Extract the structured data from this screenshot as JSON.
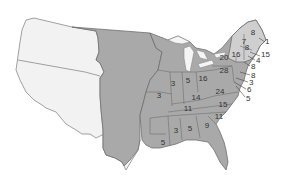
{
  "map": {
    "colors": {
      "background": "#ffffff",
      "territory_light": "#f2f2f2",
      "states_dark": "#a9a9a9",
      "new_england_light": "#cfcfcf",
      "border": "#6e6e6e",
      "lakes": "#f5f5f5"
    },
    "state_labels": [
      {
        "value": "8",
        "x": 253,
        "y": 33
      },
      {
        "value": "1",
        "x": 266,
        "y": 42
      },
      {
        "value": "7",
        "x": 244,
        "y": 42
      },
      {
        "value": "8",
        "x": 247,
        "y": 48
      },
      {
        "value": "16",
        "x": 236,
        "y": 55
      },
      {
        "value": "20",
        "x": 224,
        "y": 58
      },
      {
        "value": "28",
        "x": 224,
        "y": 71
      },
      {
        "value": "16",
        "x": 203,
        "y": 79
      },
      {
        "value": "5",
        "x": 188,
        "y": 81
      },
      {
        "value": "3",
        "x": 173,
        "y": 84
      },
      {
        "value": "3",
        "x": 159,
        "y": 96
      },
      {
        "value": "24",
        "x": 220,
        "y": 92
      },
      {
        "value": "14",
        "x": 196,
        "y": 98
      },
      {
        "value": "15",
        "x": 223,
        "y": 105
      },
      {
        "value": "11",
        "x": 188,
        "y": 109
      },
      {
        "value": "11",
        "x": 219,
        "y": 117
      },
      {
        "value": "3",
        "x": 176,
        "y": 131
      },
      {
        "value": "5",
        "x": 190,
        "y": 129
      },
      {
        "value": "9",
        "x": 207,
        "y": 126
      },
      {
        "value": "5",
        "x": 163,
        "y": 143
      }
    ],
    "leader_labels": [
      {
        "value": "15",
        "x": 262,
        "y": 55
      },
      {
        "value": "4",
        "x": 256,
        "y": 60
      },
      {
        "value": "8",
        "x": 251,
        "y": 66
      },
      {
        "value": "8",
        "x": 252,
        "y": 75
      },
      {
        "value": "3",
        "x": 249,
        "y": 82
      },
      {
        "value": "6",
        "x": 247,
        "y": 89
      },
      {
        "value": "5",
        "x": 246,
        "y": 98
      }
    ]
  }
}
